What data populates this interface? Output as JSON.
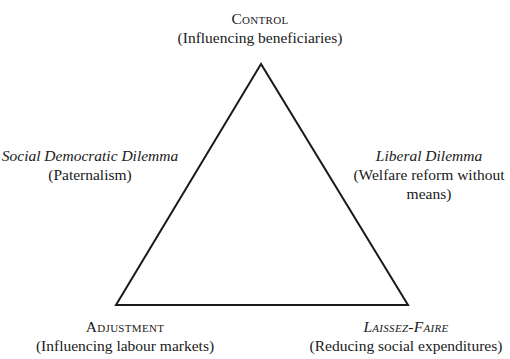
{
  "diagram": {
    "type": "triangle",
    "vertices": {
      "top": {
        "title": "Control",
        "subtitle": "(Influencing beneficiaries)"
      },
      "bottom_left": {
        "title": "Adjustment",
        "subtitle": "(Influencing labour markets)"
      },
      "bottom_right": {
        "title": "Laissez-Faire",
        "subtitle": "(Reducing social expenditures)"
      }
    },
    "edges": {
      "left": {
        "title": "Social Democratic Dilemma",
        "subtitle": "(Paternalism)"
      },
      "right": {
        "title": "Liberal Dilemma",
        "subtitle_line1": "(Welfare reform without",
        "subtitle_line2": "means)"
      }
    },
    "line_color": "#1a1a1a"
  }
}
